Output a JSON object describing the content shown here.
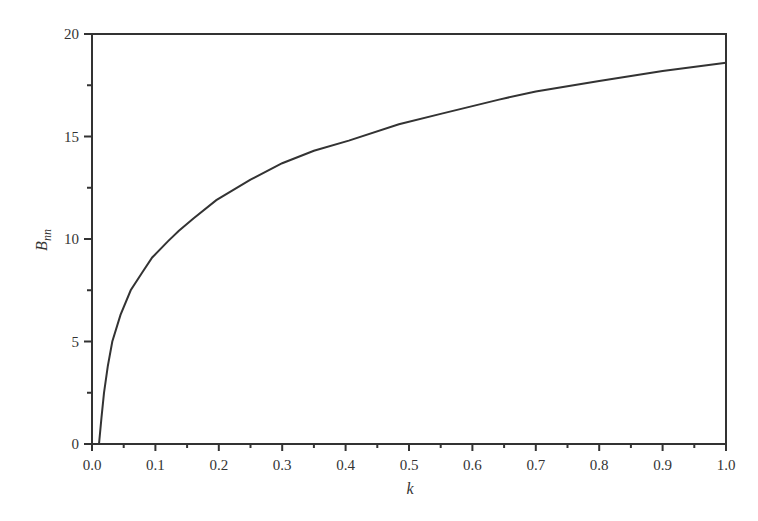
{
  "chart_data": {
    "type": "line",
    "title": "",
    "xlabel": "k",
    "ylabel": "B",
    "ylabel_subscript": "nn",
    "xlim": [
      0.0,
      1.0
    ],
    "ylim": [
      0,
      20
    ],
    "grid": false,
    "legend": null,
    "x_ticks": [
      "0.0",
      "0.1",
      "0.2",
      "0.3",
      "0.4",
      "0.5",
      "0.6",
      "0.7",
      "0.8",
      "0.9",
      "1.0"
    ],
    "y_ticks": [
      "0",
      "5",
      "10",
      "15",
      "20"
    ],
    "x_minor_step": 0.05,
    "y_minor_step": 2.5,
    "series": [
      {
        "name": "B_nn",
        "color": "#333333",
        "x": [
          0.011,
          0.015,
          0.019,
          0.025,
          0.032,
          0.045,
          0.061,
          0.08,
          0.095,
          0.12,
          0.137,
          0.16,
          0.196,
          0.25,
          0.3,
          0.35,
          0.405,
          0.484,
          0.55,
          0.642,
          0.7,
          0.8,
          0.9,
          1.0
        ],
        "values": [
          0.0,
          1.3,
          2.5,
          3.8,
          5.0,
          6.3,
          7.5,
          8.4,
          9.1,
          9.9,
          10.4,
          11.0,
          11.9,
          12.9,
          13.7,
          14.3,
          14.8,
          15.6,
          16.1,
          16.8,
          17.2,
          17.7,
          18.2,
          18.6
        ]
      }
    ]
  }
}
